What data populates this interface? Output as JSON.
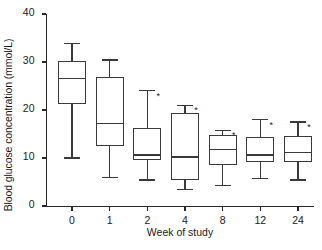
{
  "chart_data": {
    "type": "box",
    "title": "",
    "xlabel": "Week of study",
    "ylabel": "Blood glucose concentration (mmol/L)",
    "categories": [
      "0",
      "1",
      "2",
      "4",
      "8",
      "12",
      "24"
    ],
    "yticks": [
      0,
      10,
      20,
      30,
      40
    ],
    "ytick_labels": [
      "0",
      "10",
      "20",
      "30",
      "40"
    ],
    "ylim": [
      0,
      40
    ],
    "grid": false,
    "legend": null,
    "boxes": [
      {
        "category": "0",
        "whisker_low": 10.0,
        "q1": 21.3,
        "median": 26.5,
        "q3": 30.2,
        "whisker_high": 33.9,
        "significance": ""
      },
      {
        "category": "1",
        "whisker_low": 6.0,
        "q1": 12.5,
        "median": 17.2,
        "q3": 26.8,
        "whisker_high": 30.4,
        "significance": ""
      },
      {
        "category": "2",
        "whisker_low": 5.4,
        "q1": 9.5,
        "median": 10.6,
        "q3": 16.3,
        "whisker_high": 24.0,
        "significance": "*"
      },
      {
        "category": "4",
        "whisker_low": 3.5,
        "q1": 5.5,
        "median": 10.2,
        "q3": 19.4,
        "whisker_high": 21.0,
        "significance": "*"
      },
      {
        "category": "8",
        "whisker_low": 4.2,
        "q1": 8.5,
        "median": 11.7,
        "q3": 14.8,
        "whisker_high": 15.8,
        "significance": "*"
      },
      {
        "category": "12",
        "whisker_low": 5.8,
        "q1": 9.2,
        "median": 10.6,
        "q3": 14.4,
        "whisker_high": 18.0,
        "significance": "*"
      },
      {
        "category": "24",
        "whisker_low": 5.4,
        "q1": 9.2,
        "median": 11.2,
        "q3": 14.6,
        "whisker_high": 17.5,
        "significance": "*"
      }
    ]
  },
  "colors": {
    "line": "#3a3a3a",
    "axis": "#262626",
    "text": "#1a1a1a",
    "background": "#ffffff"
  }
}
